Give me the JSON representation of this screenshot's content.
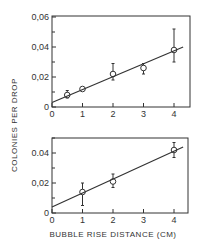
{
  "chart_data": [
    {
      "type": "scatter",
      "panel": "top",
      "title": "",
      "xlabel": "",
      "ylabel": "COLONIES PER DROP",
      "xlim": [
        0,
        4.3
      ],
      "ylim": [
        0,
        0.06
      ],
      "x_ticks": [
        "0",
        "1",
        "2",
        "3",
        "4"
      ],
      "y_ticks": [
        "0",
        "0,02",
        "0,04",
        "0,06"
      ],
      "grid": false,
      "series": [
        {
          "name": "data",
          "marker": "open-circle",
          "x": [
            0.5,
            1,
            2,
            3,
            4
          ],
          "y": [
            0.008,
            0.012,
            0.022,
            0.026,
            0.038
          ],
          "err_low": [
            0.006,
            0.012,
            0.018,
            0.022,
            0.03
          ],
          "err_high": [
            0.011,
            0.012,
            0.029,
            0.029,
            0.052
          ]
        },
        {
          "name": "fit",
          "type": "line",
          "x": [
            0,
            4.3
          ],
          "y": [
            0.003,
            0.04
          ]
        }
      ]
    },
    {
      "type": "scatter",
      "panel": "bottom",
      "title": "",
      "xlabel": "BUBBLE RISE DISTANCE (CM)",
      "ylabel": "COLONIES PER DROP",
      "xlim": [
        0,
        4.3
      ],
      "ylim": [
        0,
        0.05
      ],
      "x_ticks": [
        "0",
        "1",
        "2",
        "3",
        "4"
      ],
      "y_ticks": [
        "0",
        "0,02",
        "0.04"
      ],
      "grid": false,
      "series": [
        {
          "name": "data",
          "marker": "open-circle",
          "x": [
            1,
            2,
            4
          ],
          "y": [
            0.014,
            0.021,
            0.042
          ],
          "err_low": [
            0.005,
            0.017,
            0.037
          ],
          "err_high": [
            0.02,
            0.026,
            0.047
          ]
        },
        {
          "name": "fit",
          "type": "line",
          "x": [
            0,
            4.3
          ],
          "y": [
            0.004,
            0.044
          ]
        }
      ]
    }
  ],
  "labels": {
    "ylabel": "COLONIES PER DROP",
    "xlabel": "BUBBLE RISE DISTANCE (CM)"
  }
}
